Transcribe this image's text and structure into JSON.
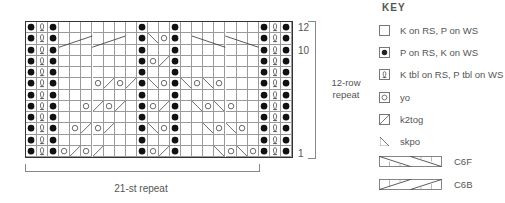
{
  "chart": {
    "columns": 24,
    "rows": 12,
    "row_labels": [
      {
        "row": 12,
        "label": "12"
      },
      {
        "row": 10,
        "label": "10"
      },
      {
        "row": 1,
        "label": "1"
      }
    ],
    "row_repeat_label_line1": "12-row",
    "row_repeat_label_line2": "repeat",
    "stitch_repeat_label": "21-st repeat",
    "grid": {
      "12": [
        "P",
        "T",
        "P",
        "K",
        "K",
        "K",
        "K",
        "K",
        "K",
        "K",
        "P",
        "K",
        "K",
        "P",
        "K",
        "K",
        "K",
        "K",
        "K",
        "K",
        "K",
        "P",
        "T",
        "P"
      ],
      "11": [
        "P",
        "T",
        "P",
        "C6B",
        "C6B",
        "C6B",
        "C6B",
        "C6B",
        "C6B",
        "K",
        "P",
        "S",
        "Y",
        "P",
        "K",
        "C6F",
        "C6F",
        "C6F",
        "C6F",
        "C6F",
        "C6F",
        "P",
        "T",
        "P"
      ],
      "10": [
        "P",
        "T",
        "P",
        "K",
        "K",
        "K",
        "K",
        "K",
        "K",
        "K",
        "P",
        "K",
        "K",
        "P",
        "K",
        "K",
        "K",
        "K",
        "K",
        "K",
        "K",
        "P",
        "T",
        "P"
      ],
      "9": [
        "P",
        "T",
        "P",
        "K",
        "K",
        "K",
        "K",
        "K",
        "K",
        "K",
        "P",
        "Y",
        "Z",
        "P",
        "K",
        "K",
        "K",
        "K",
        "K",
        "K",
        "K",
        "P",
        "T",
        "P"
      ],
      "8": [
        "P",
        "T",
        "P",
        "K",
        "K",
        "K",
        "K",
        "K",
        "K",
        "K",
        "P",
        "K",
        "K",
        "P",
        "K",
        "K",
        "K",
        "K",
        "K",
        "K",
        "K",
        "P",
        "T",
        "P"
      ],
      "7": [
        "P",
        "T",
        "P",
        "K",
        "K",
        "K",
        "Y",
        "Z",
        "Y",
        "Z",
        "P",
        "S",
        "Y",
        "P",
        "S",
        "Y",
        "S",
        "Y",
        "K",
        "K",
        "K",
        "P",
        "T",
        "P"
      ],
      "6": [
        "P",
        "T",
        "P",
        "K",
        "K",
        "K",
        "K",
        "K",
        "K",
        "K",
        "P",
        "K",
        "K",
        "P",
        "K",
        "K",
        "K",
        "K",
        "K",
        "K",
        "K",
        "P",
        "T",
        "P"
      ],
      "5": [
        "P",
        "T",
        "P",
        "K",
        "K",
        "Y",
        "Z",
        "Y",
        "Z",
        "K",
        "P",
        "Y",
        "Z",
        "P",
        "K",
        "S",
        "Y",
        "S",
        "Y",
        "K",
        "K",
        "P",
        "T",
        "P"
      ],
      "4": [
        "P",
        "T",
        "P",
        "K",
        "K",
        "K",
        "K",
        "K",
        "K",
        "K",
        "P",
        "K",
        "K",
        "P",
        "K",
        "K",
        "K",
        "K",
        "K",
        "K",
        "K",
        "P",
        "T",
        "P"
      ],
      "3": [
        "P",
        "T",
        "P",
        "K",
        "Y",
        "Z",
        "Y",
        "Z",
        "K",
        "K",
        "P",
        "S",
        "Y",
        "P",
        "K",
        "K",
        "S",
        "Y",
        "S",
        "Y",
        "K",
        "P",
        "T",
        "P"
      ],
      "2": [
        "P",
        "T",
        "P",
        "K",
        "K",
        "K",
        "K",
        "K",
        "K",
        "K",
        "P",
        "K",
        "K",
        "P",
        "K",
        "K",
        "K",
        "K",
        "K",
        "K",
        "K",
        "P",
        "T",
        "P"
      ],
      "1": [
        "P",
        "T",
        "P",
        "Y",
        "Z",
        "Y",
        "Z",
        "K",
        "K",
        "K",
        "P",
        "Y",
        "Z",
        "P",
        "K",
        "K",
        "K",
        "S",
        "Y",
        "S",
        "Y",
        "P",
        "T",
        "P"
      ]
    },
    "cables": [
      {
        "row": 11,
        "type": "C6B",
        "start_col": 3,
        "width": 6
      },
      {
        "row": 11,
        "type": "C6F",
        "start_col": 15,
        "width": 6
      }
    ]
  },
  "key": {
    "title": "KEY",
    "items": [
      {
        "symbol": "knit-blank",
        "label": "K on RS, P on WS"
      },
      {
        "symbol": "purl-dot",
        "label": "P on RS, K on WS"
      },
      {
        "symbol": "ktbl-twist",
        "label": "K tbl on RS, P tbl on WS"
      },
      {
        "symbol": "yo-circle",
        "label": "yo"
      },
      {
        "symbol": "k2tog-slash",
        "label": "k2tog"
      },
      {
        "symbol": "skpo-backslash",
        "label": "skpo"
      },
      {
        "symbol": "c6f-cable",
        "label": "C6F"
      },
      {
        "symbol": "c6b-cable",
        "label": "C6B"
      }
    ]
  },
  "colors": {
    "grid_line": "#9a9a9a",
    "border": "#333333",
    "symbol": "#222222",
    "text": "#555555"
  }
}
